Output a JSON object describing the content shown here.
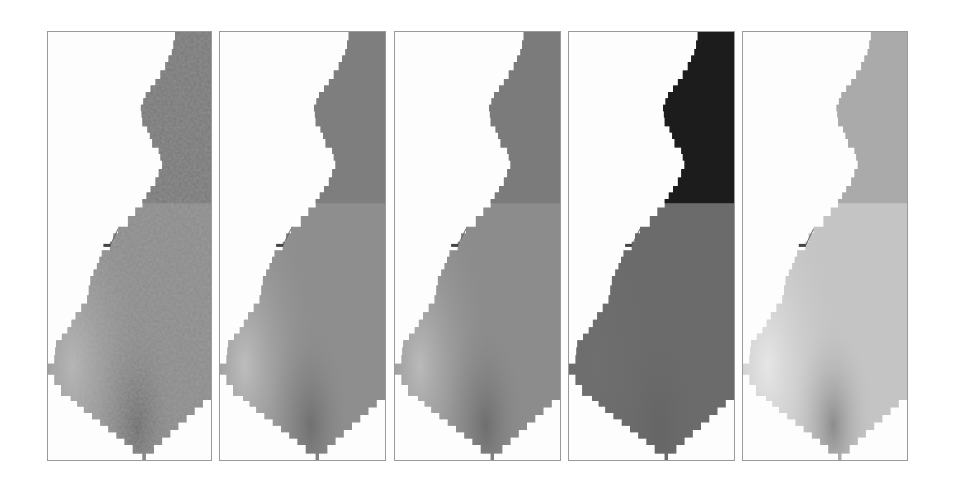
{
  "figure": {
    "panel_count": 5,
    "panels": [
      {
        "id": "panel-1",
        "left": 47,
        "width": 165,
        "style": "noisy",
        "base": "#8a8a8a",
        "light": "#b4b4b4",
        "dark": "#6a6a6a",
        "top_region": "#777777"
      },
      {
        "id": "panel-2",
        "left": 219,
        "width": 167,
        "style": "smooth",
        "base": "#8e8e8e",
        "light": "#bdbdbd",
        "dark": "#707070",
        "top_region": "#7e7e7e"
      },
      {
        "id": "panel-3",
        "left": 394,
        "width": 167,
        "style": "smooth",
        "base": "#8c8c8c",
        "light": "#bababa",
        "dark": "#6e6e6e",
        "top_region": "#7b7b7b"
      },
      {
        "id": "panel-4",
        "left": 568,
        "width": 167,
        "style": "flat",
        "base": "#6b6b6b",
        "light": "#6f6f6f",
        "dark": "#656565",
        "top_region": "#1c1c1c"
      },
      {
        "id": "panel-5",
        "left": 742,
        "width": 166,
        "style": "smooth-light",
        "base": "#c4c4c4",
        "light": "#e6e6e6",
        "dark": "#8c8c8c",
        "top_region": "#aaaaaa"
      }
    ]
  }
}
